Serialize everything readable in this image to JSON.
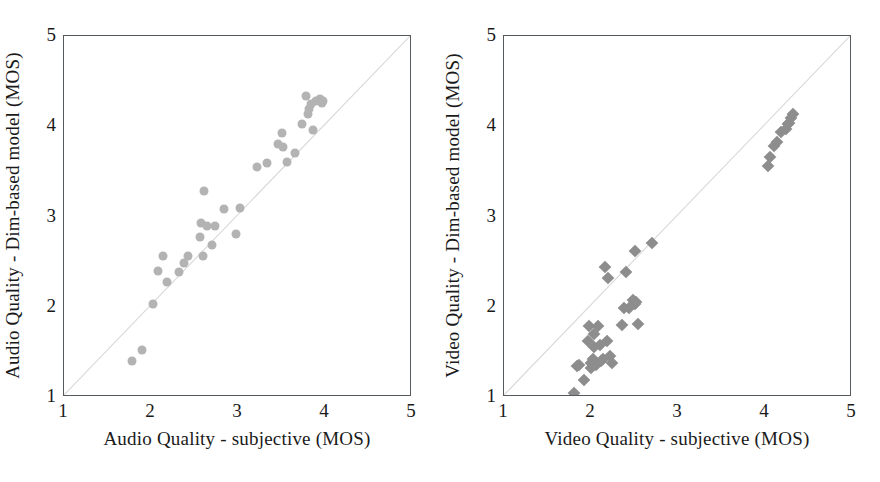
{
  "figure": {
    "background": "#ffffff",
    "marker_color_left": "#b3b3b3",
    "marker_color_right": "#8d8d8d",
    "frame_color": "#555a5e",
    "diagonal_color": "#d8d8d8"
  },
  "chart_data": [
    {
      "type": "scatter",
      "title": "",
      "panel": "left",
      "xlabel": "Audio Quality - subjective (MOS)",
      "ylabel": "Audio Quality - Dim-based model (MOS)",
      "xlim": [
        1,
        5
      ],
      "ylim": [
        1,
        5
      ],
      "xticks": [
        "1",
        "2",
        "3",
        "4",
        "5"
      ],
      "yticks": [
        "1",
        "2",
        "3",
        "4",
        "5"
      ],
      "xtick_values": [
        1,
        2,
        3,
        4,
        5
      ],
      "ytick_values": [
        1,
        2,
        3,
        4,
        5
      ],
      "grid": false,
      "legend": "none",
      "marker": "circle",
      "reference_line": {
        "type": "identity",
        "label": "y = x",
        "from": [
          1,
          1
        ],
        "to": [
          5,
          5
        ]
      },
      "x": [
        1.78,
        1.9,
        2.02,
        2.08,
        2.14,
        2.18,
        2.32,
        2.38,
        2.42,
        2.56,
        2.58,
        2.6,
        2.61,
        2.64,
        2.7,
        2.73,
        2.84,
        2.98,
        3.02,
        3.22,
        3.33,
        3.46,
        3.5,
        3.52,
        3.56,
        3.66,
        3.74,
        3.78,
        3.8,
        3.82,
        3.84,
        3.86,
        3.9,
        3.94,
        3.96,
        3.98
      ],
      "y": [
        1.4,
        1.52,
        2.03,
        2.4,
        2.56,
        2.27,
        2.39,
        2.49,
        2.56,
        2.77,
        2.93,
        2.56,
        3.28,
        2.89,
        2.68,
        2.89,
        3.08,
        2.81,
        3.09,
        3.55,
        3.59,
        3.8,
        3.93,
        3.77,
        3.6,
        3.7,
        4.03,
        4.33,
        4.14,
        4.19,
        4.25,
        3.96,
        4.28,
        4.3,
        4.26,
        4.28
      ]
    },
    {
      "type": "scatter",
      "title": "",
      "panel": "right",
      "xlabel": "Video Quality - subjective (MOS)",
      "ylabel": "Video Quality - Dim-based model (MOS)",
      "xlim": [
        1,
        5
      ],
      "ylim": [
        1,
        5
      ],
      "xticks": [
        "1",
        "2",
        "3",
        "4",
        "5"
      ],
      "yticks": [
        "1",
        "2",
        "3",
        "4",
        "5"
      ],
      "xtick_values": [
        1,
        2,
        3,
        4,
        5
      ],
      "ytick_values": [
        1,
        2,
        3,
        4,
        5
      ],
      "grid": false,
      "legend": "none",
      "marker": "diamond",
      "reference_line": {
        "type": "identity",
        "label": "y = x",
        "from": [
          1,
          1
        ],
        "to": [
          5,
          5
        ]
      },
      "x": [
        1.8,
        1.84,
        1.86,
        1.92,
        1.96,
        1.98,
        2.0,
        2.0,
        2.02,
        2.04,
        2.04,
        2.06,
        2.08,
        2.1,
        2.12,
        2.14,
        2.16,
        2.18,
        2.2,
        2.22,
        2.24,
        2.36,
        2.38,
        2.4,
        2.44,
        2.48,
        2.5,
        2.5,
        2.52,
        2.54,
        2.7,
        4.04,
        4.06,
        4.1,
        4.14,
        4.18,
        4.24,
        4.26,
        4.28,
        4.3,
        4.32
      ],
      "y": [
        1.04,
        1.34,
        1.36,
        1.19,
        1.62,
        1.79,
        1.38,
        1.32,
        1.42,
        1.7,
        1.55,
        1.36,
        1.79,
        1.58,
        1.4,
        1.42,
        2.44,
        1.62,
        2.32,
        1.45,
        1.38,
        1.8,
        1.99,
        2.38,
        1.99,
        2.08,
        2.03,
        2.62,
        2.05,
        1.81,
        2.71,
        3.56,
        3.66,
        3.78,
        3.83,
        3.94,
        3.97,
        4.02,
        4.04,
        4.09,
        4.14
      ]
    }
  ]
}
